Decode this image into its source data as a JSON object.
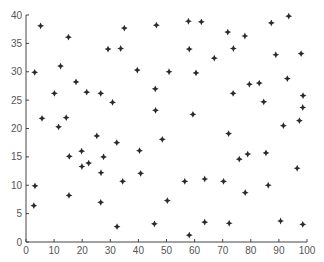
{
  "chart_data": {
    "type": "scatter",
    "title": "",
    "xlabel": "",
    "ylabel": "",
    "xlim": [
      0,
      100
    ],
    "ylim": [
      0,
      40
    ],
    "grid": false,
    "legend": null,
    "marker": "star-4pt",
    "marker_color": "#2a2a2a",
    "axis_color": "#444444",
    "xticks": [
      0,
      10,
      20,
      30,
      40,
      50,
      60,
      70,
      80,
      90,
      100
    ],
    "yticks": [
      0,
      5,
      10,
      15,
      20,
      25,
      30,
      35,
      40
    ],
    "series": [
      {
        "name": "points",
        "x": [
          5.2,
          15.1,
          3.1,
          12.3,
          17.8,
          29.2,
          10.1,
          21.6,
          26.6,
          30.8,
          5.7,
          14.3,
          11.6,
          25.2,
          32.3,
          15.4,
          19.8,
          27.6,
          22.3,
          19.9,
          26.7,
          3.2,
          15.3,
          2.8,
          26.6,
          32.4,
          35.0,
          46.4,
          57.8,
          62.4,
          33.7,
          58.1,
          39.6,
          50.9,
          60.5,
          46.0,
          46.1,
          59.4,
          48.5,
          40.4,
          40.8,
          34.4,
          56.5,
          63.6,
          50.3,
          45.7,
          63.6,
          58.1,
          93.5,
          87.3,
          71.8,
          77.9,
          73.8,
          67.0,
          88.9,
          97.9,
          79.5,
          83.0,
          93.0,
          73.7,
          84.6,
          98.6,
          98.5,
          97.3,
          91.6,
          72.1,
          85.4,
          78.9,
          75.9,
          96.5,
          70.3,
          86.2,
          78.0,
          72.3,
          90.6,
          98.5
        ],
        "y": [
          38.1,
          36.1,
          29.9,
          31.0,
          28.2,
          34.0,
          26.2,
          26.4,
          26.2,
          24.6,
          21.8,
          21.9,
          20.3,
          18.7,
          17.5,
          15.1,
          16.0,
          15.0,
          13.9,
          13.3,
          12.2,
          9.9,
          8.2,
          6.4,
          7.0,
          2.7,
          37.7,
          38.2,
          38.9,
          38.8,
          34.1,
          34.0,
          30.3,
          30.0,
          29.8,
          27.0,
          23.2,
          22.5,
          18.1,
          16.1,
          12.1,
          10.7,
          10.7,
          11.1,
          7.3,
          3.2,
          3.5,
          1.2,
          39.8,
          38.6,
          37.0,
          36.3,
          34.1,
          32.4,
          33.0,
          33.2,
          27.8,
          28.0,
          28.8,
          26.2,
          24.7,
          25.8,
          23.7,
          21.4,
          20.5,
          19.1,
          15.7,
          15.5,
          14.6,
          13.0,
          10.7,
          10.0,
          8.7,
          3.3,
          3.7,
          3.1
        ]
      }
    ]
  }
}
